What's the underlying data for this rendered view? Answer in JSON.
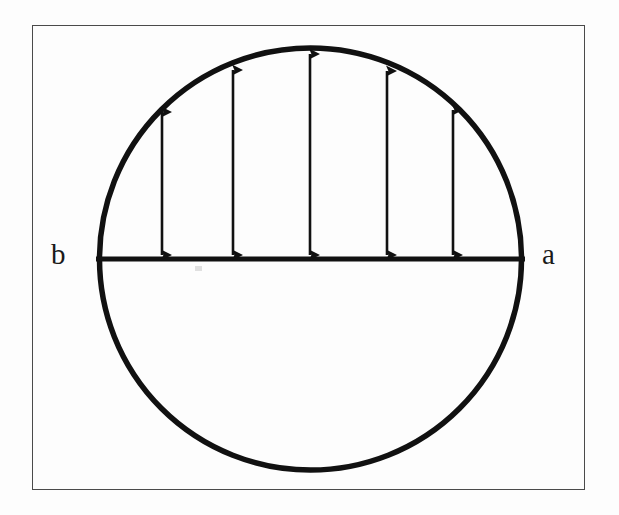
{
  "figure": {
    "frame": {
      "x": 32,
      "y": 25,
      "width": 553,
      "height": 465,
      "border_color": "#4a4a4a",
      "border_width": 1.4
    },
    "background_color": "#fdfdfd",
    "ink_color": "#111111",
    "circle": {
      "center_x": 310.5,
      "center_y": 259,
      "radius": 211,
      "stroke_width": 5.5
    },
    "diameter_line": {
      "x1": 95,
      "y1": 259,
      "x2": 526,
      "y2": 259,
      "stroke_width": 5
    },
    "labels": [
      {
        "id": "label-b",
        "text": "b",
        "x": 51,
        "y": 240,
        "anchor": "diameter-left-endpoint"
      },
      {
        "id": "label-a",
        "text": "a",
        "x": 542,
        "y": 240,
        "anchor": "diameter-right-endpoint"
      }
    ],
    "arrows": {
      "count": 5,
      "style": "double-headed vertical",
      "stroke_width": 2.6,
      "head_length": 18,
      "head_half_width": 7,
      "baseline_y": 259,
      "items": [
        {
          "index": 1,
          "x": 162,
          "top_y": 108,
          "bottom_y": 259,
          "length": 151
        },
        {
          "index": 2,
          "x": 233,
          "top_y": 65,
          "bottom_y": 259,
          "length": 194
        },
        {
          "index": 3,
          "x": 310,
          "top_y": 49,
          "bottom_y": 259,
          "length": 210
        },
        {
          "index": 4,
          "x": 387,
          "top_y": 66,
          "bottom_y": 259,
          "length": 193
        },
        {
          "index": 5,
          "x": 453,
          "top_y": 105,
          "bottom_y": 259,
          "length": 154
        }
      ]
    },
    "artifacts": [
      {
        "id": "scan-smudge",
        "x": 195,
        "y": 266,
        "width": 7,
        "height": 5
      }
    ]
  }
}
